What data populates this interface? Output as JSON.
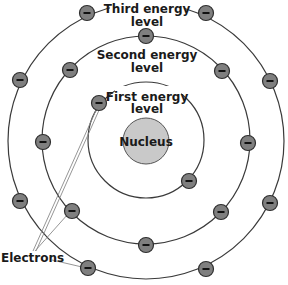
{
  "diagram": {
    "center": [
      146,
      140
    ],
    "nucleus": {
      "label": "Nucleus",
      "radius": 23
    },
    "levels": [
      {
        "name": "first",
        "label_line1": "First energy",
        "label_line2": "level",
        "radius": 58
      },
      {
        "name": "second",
        "label_line1": "Second energy",
        "label_line2": "level",
        "radius": 104
      },
      {
        "name": "third",
        "label_line1": "Third energy",
        "label_line2": "level",
        "radius": 138
      }
    ],
    "electrons": [
      {
        "level": "first",
        "x": 99,
        "y": 103
      },
      {
        "level": "first",
        "x": 189,
        "y": 181
      },
      {
        "level": "second",
        "x": 146,
        "y": 36
      },
      {
        "level": "second",
        "x": 70,
        "y": 70
      },
      {
        "level": "second",
        "x": 222,
        "y": 71
      },
      {
        "level": "second",
        "x": 43,
        "y": 142
      },
      {
        "level": "second",
        "x": 248,
        "y": 143
      },
      {
        "level": "second",
        "x": 72,
        "y": 211
      },
      {
        "level": "second",
        "x": 221,
        "y": 212
      },
      {
        "level": "second",
        "x": 146,
        "y": 245
      },
      {
        "level": "third",
        "x": 87,
        "y": 13
      },
      {
        "level": "third",
        "x": 206,
        "y": 13
      },
      {
        "level": "third",
        "x": 20,
        "y": 80
      },
      {
        "level": "third",
        "x": 270,
        "y": 81
      },
      {
        "level": "third",
        "x": 20,
        "y": 201
      },
      {
        "level": "third",
        "x": 270,
        "y": 203
      },
      {
        "level": "third",
        "x": 88,
        "y": 268
      },
      {
        "level": "third",
        "x": 206,
        "y": 269
      }
    ],
    "electron_symbol": "−",
    "callout": {
      "label": "Electrons"
    }
  }
}
